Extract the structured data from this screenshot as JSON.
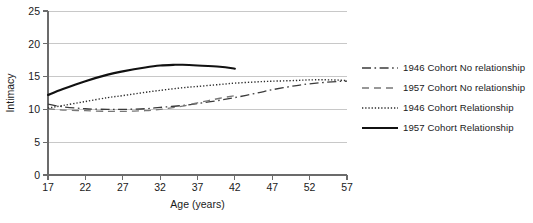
{
  "chart_data": {
    "type": "line",
    "title": "",
    "subtitle": "",
    "xlabel": "Age (years)",
    "ylabel": "Intimacy",
    "xlim": [
      17,
      57
    ],
    "ylim": [
      0,
      25
    ],
    "xticks": [
      17,
      22,
      27,
      32,
      37,
      42,
      47,
      52,
      57
    ],
    "yticks": [
      0,
      5,
      10,
      15,
      20,
      25
    ],
    "grid": "horizontal",
    "legend_position": "right",
    "series": [
      {
        "name": "1946 Cohort No relationship",
        "style": "dash-dot",
        "color": "#3b3b3b",
        "width": 1.3,
        "x": [
          17,
          19,
          22,
          25,
          27,
          30,
          32,
          35,
          37,
          40,
          42,
          45,
          47,
          50,
          52,
          55,
          57
        ],
        "y": [
          10.8,
          10.4,
          10.1,
          10.0,
          10.0,
          10.1,
          10.3,
          10.6,
          10.9,
          11.4,
          11.8,
          12.5,
          13.0,
          13.6,
          13.9,
          14.2,
          14.3
        ]
      },
      {
        "name": "1957 Cohort No relationship",
        "style": "dashed",
        "color": "#777777",
        "width": 1.3,
        "x": [
          17,
          19,
          22,
          25,
          27,
          30,
          32,
          35,
          37,
          40,
          42
        ],
        "y": [
          10.1,
          9.9,
          9.8,
          9.7,
          9.7,
          9.8,
          10.0,
          10.5,
          11.0,
          11.7,
          12.1
        ]
      },
      {
        "name": "1946 Cohort Relationship",
        "style": "dotted",
        "color": "#2b2b2b",
        "width": 1.4,
        "x": [
          17,
          19,
          22,
          25,
          27,
          30,
          32,
          35,
          37,
          40,
          42,
          45,
          47,
          50,
          52,
          55,
          57
        ],
        "y": [
          10.2,
          10.6,
          11.2,
          11.8,
          12.1,
          12.6,
          12.9,
          13.3,
          13.5,
          13.8,
          14.0,
          14.2,
          14.3,
          14.4,
          14.5,
          14.5,
          14.4
        ]
      },
      {
        "name": "1957 Cohort Relationship",
        "style": "solid",
        "color": "#111111",
        "width": 2.1,
        "x": [
          17,
          19,
          22,
          25,
          27,
          30,
          32,
          34,
          35,
          37,
          40,
          42
        ],
        "y": [
          12.2,
          13.1,
          14.3,
          15.3,
          15.8,
          16.4,
          16.7,
          16.8,
          16.8,
          16.7,
          16.5,
          16.2
        ]
      }
    ]
  },
  "legend": {
    "items": [
      {
        "label": "1946 Cohort No relationship",
        "style": "dash-dot"
      },
      {
        "label": "1957 Cohort No relationship",
        "style": "dashed"
      },
      {
        "label": "1946 Cohort Relationship",
        "style": "dotted"
      },
      {
        "label": "1957 Cohort Relationship",
        "style": "solid"
      }
    ]
  },
  "axes": {
    "x_title": "Age (years)",
    "y_title": "Intimacy",
    "x_tick_labels": [
      "17",
      "22",
      "27",
      "32",
      "37",
      "42",
      "47",
      "52",
      "57"
    ],
    "y_tick_labels": [
      "0",
      "5",
      "10",
      "15",
      "20",
      "25"
    ]
  },
  "colors": {
    "gridline": "#c8c8c8",
    "axis": "#6b6b6b",
    "text": "#1a1a1a",
    "background": "#ffffff"
  }
}
